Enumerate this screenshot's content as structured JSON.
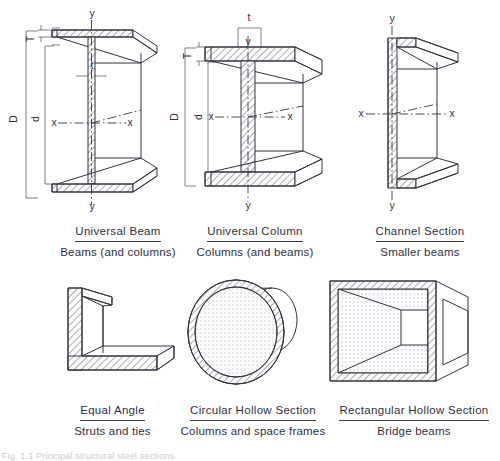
{
  "figure": {
    "footnote": "Fig. 1.1  Principal structural steel sections"
  },
  "sections": [
    {
      "id": "universal-beam",
      "title": "Universal Beam",
      "subtitle": "Beams (and columns)",
      "dimensions": [
        "D",
        "d",
        "T",
        "t"
      ],
      "axes": [
        "x",
        "x",
        "y",
        "y"
      ]
    },
    {
      "id": "universal-column",
      "title": "Universal Column",
      "subtitle": "Columns (and beams)",
      "dimensions": [
        "D",
        "d",
        "T",
        "t"
      ],
      "axes": [
        "x",
        "x",
        "y",
        "y"
      ]
    },
    {
      "id": "channel-section",
      "title": "Channel Section",
      "subtitle": "Smaller beams",
      "dimensions": [],
      "axes": [
        "x",
        "x",
        "y",
        "y"
      ]
    },
    {
      "id": "equal-angle",
      "title": "Equal Angle",
      "subtitle": "Struts and ties",
      "dimensions": [],
      "axes": []
    },
    {
      "id": "circular-hollow-section",
      "title": "Circular Hollow Section",
      "subtitle": "Columns and space frames",
      "dimensions": [],
      "axes": []
    },
    {
      "id": "rectangular-hollow-section",
      "title": "Rectangular Hollow Section",
      "subtitle": "Bridge beams",
      "dimensions": [],
      "axes": []
    }
  ],
  "labels": {
    "D": "D",
    "d": "d",
    "T": "T",
    "t": "t",
    "x": "x",
    "y": "y"
  }
}
